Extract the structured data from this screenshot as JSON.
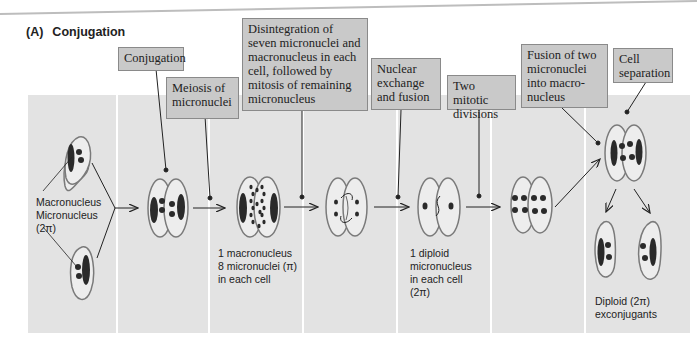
{
  "figure": {
    "panel_tag": "(A)",
    "title": "Conjugation"
  },
  "callouts": [
    {
      "id": "conjugation",
      "text": "Conjugation"
    },
    {
      "id": "meiosis",
      "text": "Meiosis of micronuclei"
    },
    {
      "id": "disintegration",
      "text": "Disintegration of seven micronuclei and macronucleus in each cell, followed by mitosis of remaining micronucleus"
    },
    {
      "id": "nuclear-exchange",
      "text": "Nuclear exchange and fusion"
    },
    {
      "id": "two-mitotic",
      "text": "Two mitotic divisions"
    },
    {
      "id": "fusion",
      "text": "Fusion of two micronuclei into macro-nucleus"
    },
    {
      "id": "cell-separation",
      "text": "Cell separation"
    }
  ],
  "labels": {
    "macronucleus": "Macronucleus",
    "micronucleus": "Micronucleus",
    "two_n": "(2π)",
    "stage2_line1": "1 macronucleus",
    "stage2_line2": "8 micronuclei (π)",
    "stage2_line3": "in each cell",
    "stage4_line1": "1 diploid",
    "stage4_line2": "micronucleus",
    "stage4_line3": "in each cell",
    "stage4_line4": "(2π)",
    "final_line1": "Diploid (2π)",
    "final_line2": "exconjugants"
  },
  "colors": {
    "panel_bg": "#e3e3e3",
    "callout_bg": "#c9c9c9",
    "cell_fill": "#ededed",
    "cell_outline": "#7a7a7a",
    "nucleus": "#2a2a2a",
    "line": "#222222"
  }
}
